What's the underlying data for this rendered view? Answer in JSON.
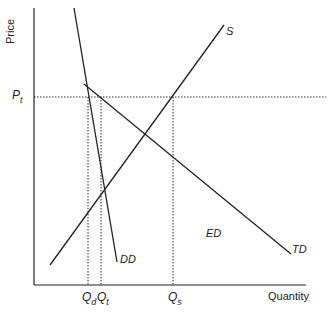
{
  "axes": {
    "y_label": "Price",
    "x_label": "Quantity"
  },
  "price_level": {
    "symbol": "P",
    "subscript": "t"
  },
  "quantity_ticks": [
    {
      "symbol": "Q",
      "subscript": "d"
    },
    {
      "symbol": "Q",
      "subscript": "t"
    },
    {
      "symbol": "Q",
      "subscript": "s"
    }
  ],
  "curves": {
    "supply": "S",
    "domestic_demand": "DD",
    "total_demand": "TD",
    "export_demand": "ED"
  },
  "colors": {
    "line": "#222222",
    "background": "#ffffff"
  }
}
